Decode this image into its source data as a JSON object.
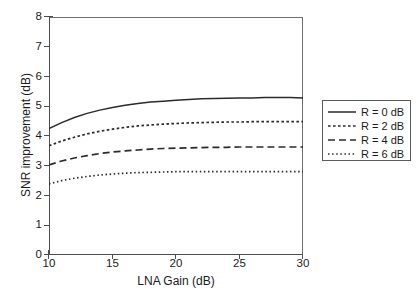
{
  "chart_data": {
    "type": "line",
    "title": "",
    "xlabel": "LNA Gain (dB)",
    "ylabel": "SNR improvement (dB)",
    "xlim": [
      10,
      30
    ],
    "ylim": [
      0,
      8
    ],
    "xticks": [
      10,
      15,
      20,
      25,
      30
    ],
    "yticks": [
      0,
      1,
      2,
      3,
      4,
      5,
      6,
      7,
      8
    ],
    "xtick_labels": [
      "10",
      "15",
      "20",
      "25",
      "30"
    ],
    "ytick_labels": [
      "0",
      "1",
      "2",
      "3",
      "4",
      "5",
      "6",
      "7",
      "8"
    ],
    "grid": false,
    "legend_position": "right-outside",
    "x": [
      10,
      11,
      12,
      13,
      14,
      15,
      16,
      17,
      18,
      19,
      20,
      21,
      22,
      23,
      24,
      25,
      26,
      27,
      28,
      29,
      30
    ],
    "series": [
      {
        "name": "R = 0 dB",
        "style": "solid",
        "color": "#2b2b2b",
        "values": [
          4.25,
          4.45,
          4.62,
          4.76,
          4.87,
          4.96,
          5.03,
          5.09,
          5.14,
          5.17,
          5.2,
          5.23,
          5.25,
          5.26,
          5.27,
          5.28,
          5.28,
          5.29,
          5.29,
          5.29,
          5.28
        ]
      },
      {
        "name": "R = 2 dB",
        "style": "dotted-coarse",
        "color": "#2b2b2b",
        "values": [
          3.67,
          3.83,
          3.96,
          4.07,
          4.16,
          4.23,
          4.29,
          4.34,
          4.37,
          4.4,
          4.42,
          4.44,
          4.45,
          4.46,
          4.47,
          4.47,
          4.48,
          4.48,
          4.48,
          4.48,
          4.48
        ]
      },
      {
        "name": "R = 4 dB",
        "style": "dashed",
        "color": "#2b2b2b",
        "values": [
          3.03,
          3.16,
          3.26,
          3.34,
          3.41,
          3.46,
          3.5,
          3.53,
          3.56,
          3.58,
          3.59,
          3.6,
          3.61,
          3.62,
          3.62,
          3.63,
          3.63,
          3.63,
          3.63,
          3.63,
          3.63
        ]
      },
      {
        "name": "R = 6 dB",
        "style": "dotted-fine",
        "color": "#2b2b2b",
        "values": [
          2.39,
          2.5,
          2.58,
          2.64,
          2.69,
          2.72,
          2.75,
          2.77,
          2.78,
          2.79,
          2.8,
          2.8,
          2.8,
          2.8,
          2.8,
          2.8,
          2.8,
          2.8,
          2.8,
          2.8,
          2.8
        ]
      }
    ]
  },
  "legend": {
    "items": [
      {
        "label": "R = 0 dB"
      },
      {
        "label": "R = 2 dB"
      },
      {
        "label": "R = 4 dB"
      },
      {
        "label": "R = 6 dB"
      }
    ]
  },
  "colors": {
    "axis": "#4d4d4d",
    "line": "#2b2b2b",
    "text": "#1a1a1a",
    "background": "#ffffff",
    "legend_border": "#5a5a5a"
  }
}
